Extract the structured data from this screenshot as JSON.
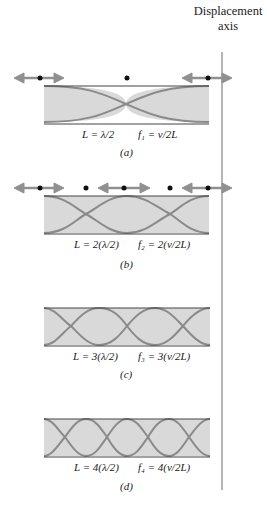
{
  "axis": {
    "title_line1": "Displacement",
    "title_line2": "axis"
  },
  "colors": {
    "fill": "#d9d9d9",
    "curve": "#8a8a8a",
    "arrow": "#909090",
    "line": "#444444",
    "axis": "#8c8c8c",
    "dot": "#111111"
  },
  "panels": [
    {
      "id": "a",
      "caption": "(a)",
      "length_eq": "L = λ/2",
      "freq_eq": "f₁ = v/2L",
      "harmonic": 1
    },
    {
      "id": "b",
      "caption": "(b)",
      "length_eq": "L = 2(λ/2)",
      "freq_eq": "f₂ = 2(v/2L)",
      "harmonic": 2
    },
    {
      "id": "c",
      "caption": "(c)",
      "length_eq": "L = 3(λ/2)",
      "freq_eq": "f₃ = 3(v/2L)",
      "harmonic": 3
    },
    {
      "id": "d",
      "caption": "(d)",
      "length_eq": "L = 4(λ/2)",
      "freq_eq": "f₄ = 4(v/2L)",
      "harmonic": 4
    }
  ]
}
